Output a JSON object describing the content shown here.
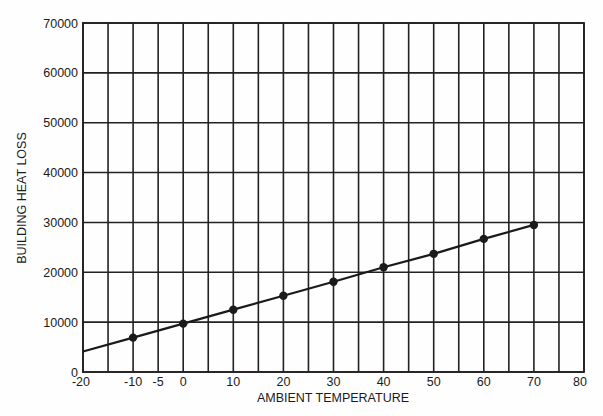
{
  "chart_data": {
    "type": "line",
    "title": "",
    "xlabel": "AMBIENT TEMPERATURE",
    "ylabel": "BUILDING HEAT LOSS",
    "xlim": [
      -20,
      80
    ],
    "ylim": [
      0,
      70000
    ],
    "grid": true,
    "grid_x_step": 5,
    "grid_y_step": 10000,
    "legend": null,
    "x_tick_labels": [
      {
        "value": -20,
        "label": "-20"
      },
      {
        "value": -10,
        "label": "-10"
      },
      {
        "value": -5,
        "label": "-5"
      },
      {
        "value": 0,
        "label": "0"
      },
      {
        "value": 10,
        "label": "10"
      },
      {
        "value": 20,
        "label": "20"
      },
      {
        "value": 30,
        "label": "30"
      },
      {
        "value": 40,
        "label": "40"
      },
      {
        "value": 50,
        "label": "50"
      },
      {
        "value": 60,
        "label": "60"
      },
      {
        "value": 70,
        "label": "70"
      },
      {
        "value": 80,
        "label": "80"
      }
    ],
    "y_tick_labels": [
      {
        "value": 0,
        "label": "0"
      },
      {
        "value": 10000,
        "label": "10000"
      },
      {
        "value": 20000,
        "label": "20000"
      },
      {
        "value": 30000,
        "label": "30000"
      },
      {
        "value": 40000,
        "label": "40000"
      },
      {
        "value": 50000,
        "label": "50000"
      },
      {
        "value": 60000,
        "label": "60000"
      },
      {
        "value": 70000,
        "label": "70000"
      }
    ],
    "series": [
      {
        "name": "Building heat loss",
        "line_start": {
          "x": -20,
          "y": 4100
        },
        "markers": true,
        "x": [
          -10,
          0,
          10,
          20,
          30,
          40,
          50,
          60,
          70
        ],
        "values": [
          6900,
          9700,
          12500,
          15300,
          18100,
          21000,
          23700,
          26700,
          29500
        ]
      }
    ],
    "colors": {
      "line": "#1a1a1a",
      "grid": "#222222",
      "background": "#fefefe"
    }
  }
}
